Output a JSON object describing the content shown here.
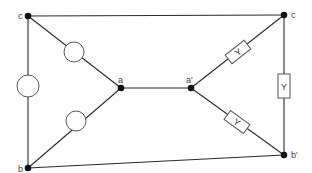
{
  "diagram": {
    "type": "circuit",
    "nodes": {
      "c_left": {
        "label": "c",
        "x": 28,
        "y": 16
      },
      "b_left": {
        "label": "b",
        "x": 28,
        "y": 168
      },
      "a": {
        "label": "a",
        "x": 121,
        "y": 88
      },
      "a_prime": {
        "label": "a'",
        "x": 191,
        "y": 88
      },
      "c_right": {
        "label": "c",
        "x": 284,
        "y": 15
      },
      "b_prime": {
        "label": "b'",
        "x": 284,
        "y": 155
      }
    },
    "components": {
      "circle_left_vertical": {
        "kind": "circle",
        "between": [
          "c",
          "b"
        ],
        "cx": 28,
        "cy": 86,
        "r": 11
      },
      "circle_upper": {
        "kind": "circle",
        "between": [
          "c",
          "a"
        ],
        "cx": 74,
        "cy": 52,
        "r": 10
      },
      "circle_lower": {
        "kind": "circle",
        "between": [
          "b",
          "a"
        ],
        "cx": 76,
        "cy": 121,
        "r": 10
      },
      "y_upper": {
        "kind": "box",
        "label": "Y",
        "between": [
          "a'",
          "c"
        ],
        "cx": 238,
        "cy": 52,
        "angle": -38
      },
      "y_vertical": {
        "kind": "box",
        "label": "Y",
        "between": [
          "c",
          "b'"
        ],
        "cx": 284,
        "cy": 86,
        "angle": 90
      },
      "y_lower": {
        "kind": "box",
        "label": "Y",
        "between": [
          "a'",
          "b'"
        ],
        "cx": 237,
        "cy": 122,
        "angle": 38
      }
    },
    "labels": {
      "c_left": "c",
      "b_left": "b",
      "a": "a",
      "a_prime": "a'",
      "c_right": "c",
      "b_prime": "b'",
      "y_upper": "Y",
      "y_vertical": "Y",
      "y_lower": "Y"
    }
  }
}
